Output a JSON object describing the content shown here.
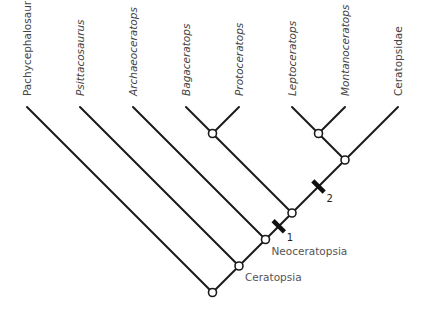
{
  "taxa": [
    {
      "id": "pachy",
      "label": "Pachycephalosauria",
      "italic": false
    },
    {
      "id": "psitt",
      "label": "Psittacosaurus",
      "italic": true
    },
    {
      "id": "archae",
      "label": "Archaeoceratops",
      "italic": true
    },
    {
      "id": "bago",
      "label": "Bagaceratops",
      "italic": true
    },
    {
      "id": "proto",
      "label": "Protoceratops",
      "italic": true
    },
    {
      "id": "lepto",
      "label": "Leptoceratops",
      "italic": true
    },
    {
      "id": "monta",
      "label": "Montanoceratops",
      "italic": true
    },
    {
      "id": "cerat",
      "label": "Ceratopsidae",
      "italic": false
    }
  ],
  "clades": [
    {
      "id": "root",
      "children": [
        "pachy",
        "ceratopsia"
      ],
      "label": ""
    },
    {
      "id": "ceratopsia",
      "children": [
        "psitt",
        "neoceratopsia"
      ],
      "label": "Ceratopsia"
    },
    {
      "id": "neoceratopsia",
      "children": [
        "archae",
        "n3"
      ],
      "label": "Neoceratopsia"
    },
    {
      "id": "n3",
      "children": [
        "bp",
        "n4"
      ],
      "label": ""
    },
    {
      "id": "bp",
      "children": [
        "bago",
        "proto"
      ],
      "label": ""
    },
    {
      "id": "n4",
      "children": [
        "lm",
        "cerat"
      ],
      "label": ""
    },
    {
      "id": "lm",
      "children": [
        "lepto",
        "monta"
      ],
      "label": ""
    }
  ],
  "character_markers": [
    {
      "label": "1",
      "on_branch": "neoceratopsia->n3"
    },
    {
      "label": "2",
      "on_branch": "n3->n4"
    }
  ],
  "colors": {
    "line": "#1a1a1a",
    "text": "#444444"
  }
}
